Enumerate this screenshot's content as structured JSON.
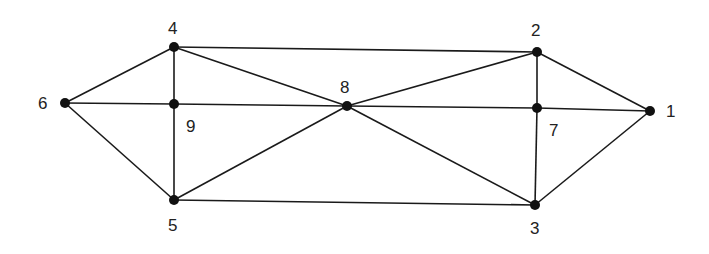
{
  "diagram": {
    "type": "graph",
    "nodes": [
      {
        "id": "1",
        "x": 650,
        "y": 111,
        "label_x": 666,
        "label_y": 117
      },
      {
        "id": "2",
        "x": 537,
        "y": 52,
        "label_x": 531,
        "label_y": 36
      },
      {
        "id": "3",
        "x": 535,
        "y": 205,
        "label_x": 530,
        "label_y": 234
      },
      {
        "id": "4",
        "x": 174,
        "y": 47,
        "label_x": 168,
        "label_y": 34
      },
      {
        "id": "5",
        "x": 174,
        "y": 200,
        "label_x": 168,
        "label_y": 231
      },
      {
        "id": "6",
        "x": 65,
        "y": 103,
        "label_x": 38,
        "label_y": 109
      },
      {
        "id": "7",
        "x": 537,
        "y": 108,
        "label_x": 549,
        "label_y": 136
      },
      {
        "id": "8",
        "x": 347,
        "y": 106,
        "label_x": 340,
        "label_y": 93
      },
      {
        "id": "9",
        "x": 174,
        "y": 104,
        "label_x": 186,
        "label_y": 132
      }
    ],
    "edges": [
      [
        "4",
        "2"
      ],
      [
        "4",
        "6"
      ],
      [
        "4",
        "9"
      ],
      [
        "4",
        "8"
      ],
      [
        "6",
        "9"
      ],
      [
        "9",
        "8"
      ],
      [
        "6",
        "5"
      ],
      [
        "9",
        "5"
      ],
      [
        "5",
        "8"
      ],
      [
        "5",
        "3"
      ],
      [
        "8",
        "2"
      ],
      [
        "8",
        "7"
      ],
      [
        "7",
        "1"
      ],
      [
        "8",
        "3"
      ],
      [
        "2",
        "7"
      ],
      [
        "7",
        "3"
      ],
      [
        "2",
        "1"
      ],
      [
        "3",
        "1"
      ]
    ]
  }
}
